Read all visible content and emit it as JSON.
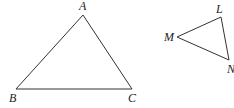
{
  "figure": {
    "triangles": [
      {
        "name": "ABC",
        "vertices": {
          "A": {
            "label": "A",
            "x": 83,
            "y": 15,
            "lx": 79,
            "ly": 10
          },
          "B": {
            "label": "B",
            "x": 16,
            "y": 89,
            "lx": 9,
            "ly": 102
          },
          "C": {
            "label": "C",
            "x": 132,
            "y": 89,
            "lx": 128,
            "ly": 102
          }
        }
      },
      {
        "name": "LMN",
        "vertices": {
          "L": {
            "label": "L",
            "x": 221,
            "y": 17,
            "lx": 216,
            "ly": 13
          },
          "M": {
            "label": "M",
            "x": 177,
            "y": 37,
            "lx": 164,
            "ly": 41
          },
          "N": {
            "label": "N",
            "x": 229,
            "y": 60,
            "lx": 227,
            "ly": 73
          }
        }
      }
    ],
    "colors": {
      "stroke": "#333333",
      "text": "#222222"
    }
  }
}
